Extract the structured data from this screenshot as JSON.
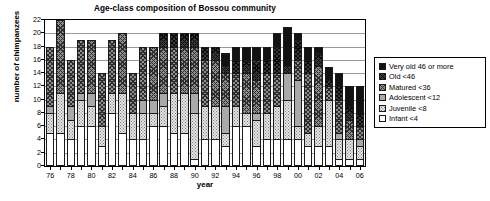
{
  "chart_data": {
    "type": "bar",
    "subtype": "stacked",
    "title": "Age-class composition of Bossou community",
    "xlabel": "year",
    "ylabel": "number of chimpanzees",
    "ylim": [
      0,
      22
    ],
    "ytick_step": 2,
    "yticks": [
      "0",
      "2",
      "4",
      "6",
      "8",
      "10",
      "12",
      "14",
      "16",
      "18",
      "20",
      "22"
    ],
    "grid": true,
    "legend_position": "right",
    "categories": [
      "76",
      "77",
      "78",
      "79",
      "80",
      "81",
      "82",
      "83",
      "84",
      "85",
      "86",
      "87",
      "88",
      "89",
      "90",
      "91",
      "92",
      "93",
      "94",
      "95",
      "96",
      "97",
      "98",
      "99",
      "00",
      "01",
      "02",
      "03",
      "04",
      "05",
      "06"
    ],
    "xtick_labels": [
      "76",
      "",
      "78",
      "",
      "80",
      "",
      "82",
      "",
      "84",
      "",
      "86",
      "",
      "88",
      "",
      "90",
      "",
      "92",
      "",
      "94",
      "",
      "96",
      "",
      "98",
      "",
      "00",
      "",
      "02",
      "",
      "04",
      "",
      "06"
    ],
    "series": [
      {
        "name": "Infant <4",
        "key": "infant",
        "pattern": "white",
        "color": "#ffffff",
        "values": [
          5,
          5,
          4,
          6,
          6,
          3,
          8,
          5,
          4,
          4,
          6,
          6,
          5,
          5,
          1,
          4,
          4,
          3,
          6,
          6,
          3,
          4,
          4,
          4,
          4,
          3,
          3,
          3,
          1,
          1,
          1
        ]
      },
      {
        "name": "Juvenile <8",
        "key": "juvenile",
        "pattern": "light-dotted",
        "color": "#e4e4e4",
        "values": [
          3,
          6,
          3,
          4,
          3,
          3,
          3,
          6,
          4,
          4,
          2,
          3,
          6,
          6,
          7,
          5,
          5,
          2,
          3,
          2,
          4,
          4,
          5,
          6,
          2,
          2,
          3,
          7,
          3,
          3,
          2
        ]
      },
      {
        "name": "Adolescent <12",
        "key": "adolescent",
        "pattern": "solid-grey",
        "color": "#a9a9a9",
        "values": [
          1,
          0,
          2,
          1,
          2,
          0,
          0,
          0,
          0,
          2,
          2,
          2,
          0,
          0,
          3,
          0,
          0,
          4,
          0,
          0,
          1,
          0,
          0,
          4,
          7,
          0,
          0,
          0,
          1,
          0,
          1
        ]
      },
      {
        "name": "Matured <36",
        "key": "matured",
        "pattern": "grey-crosshatch",
        "color": "#8f8f8f",
        "values": [
          9,
          11,
          7,
          8,
          8,
          8,
          8,
          9,
          6,
          8,
          8,
          7,
          7,
          7,
          7,
          7,
          7,
          5,
          5,
          6,
          5,
          6,
          5,
          0,
          3,
          9,
          9,
          2,
          5,
          3,
          2
        ]
      },
      {
        "name": "Old <46",
        "key": "old",
        "pattern": "dark-crosshatch",
        "color": "#3a3a3a",
        "values": [
          0,
          0,
          0,
          0,
          0,
          0,
          0,
          0,
          0,
          0,
          0,
          2,
          2,
          2,
          2,
          2,
          2,
          1,
          2,
          2,
          3,
          2,
          4,
          1,
          3,
          2,
          2,
          1,
          2,
          2,
          2
        ]
      },
      {
        "name": "Very old 46 or more",
        "key": "veryold",
        "pattern": "solid-black",
        "color": "#121212",
        "values": [
          0,
          0,
          0,
          0,
          0,
          0,
          0,
          0,
          0,
          0,
          0,
          0,
          0,
          0,
          0,
          0,
          0,
          2,
          2,
          2,
          2,
          2,
          2,
          6,
          1,
          2,
          1,
          2,
          2,
          3,
          4
        ]
      }
    ],
    "totals": [
      18,
      22,
      16,
      19,
      19,
      14,
      19,
      20,
      14,
      18,
      18,
      20,
      20,
      20,
      20,
      18,
      18,
      17,
      18,
      18,
      18,
      18,
      20,
      21,
      20,
      18,
      18,
      15,
      14,
      12,
      12
    ]
  },
  "legend": {
    "items": [
      {
        "label": "Very old 46 or more",
        "swatch": "swatch-veryold"
      },
      {
        "label": "Old <46",
        "swatch": "swatch-old"
      },
      {
        "label": "Matured <36",
        "swatch": "swatch-matured"
      },
      {
        "label": "Adolescent <12",
        "swatch": "swatch-adolescent"
      },
      {
        "label": "Juvenile <8",
        "swatch": "swatch-juvenile"
      },
      {
        "label": "Infant <4",
        "swatch": "swatch-infant"
      }
    ]
  }
}
